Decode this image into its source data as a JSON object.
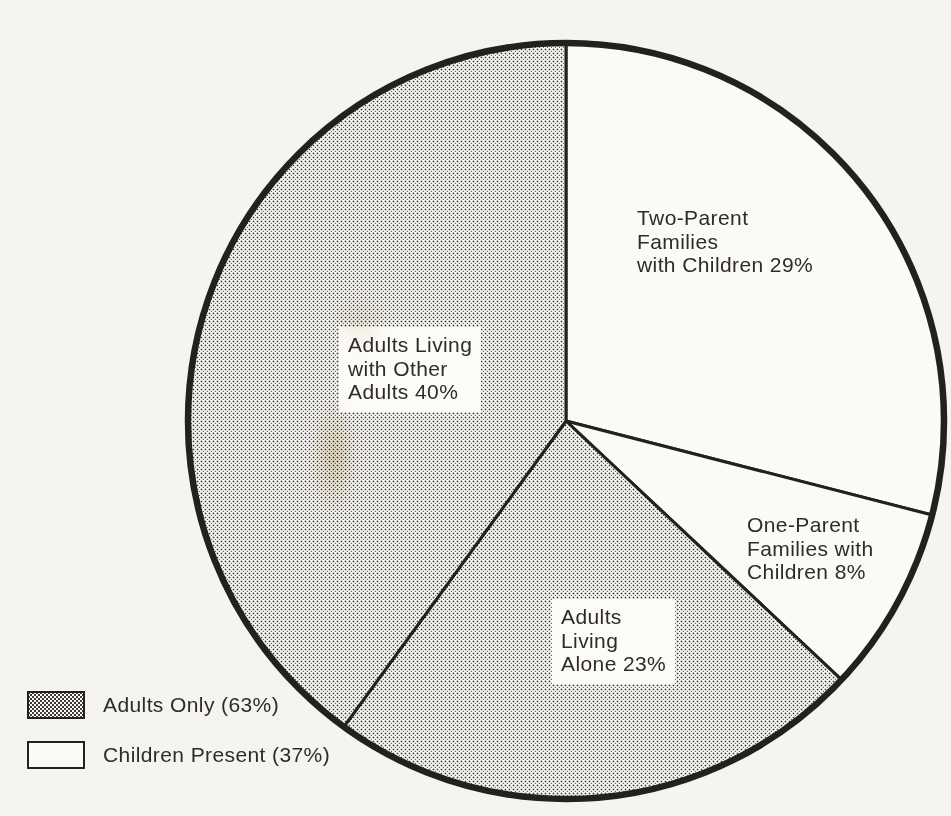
{
  "colors": {
    "ink": "#232120",
    "page_bg": "#f5f4f1",
    "slice_white": "#fbfaf7",
    "stipple_dot": "#3a3632",
    "label_box_bg": "#fcfbf8",
    "text": "#2e2c2a"
  },
  "chart_data": {
    "type": "pie",
    "direction": "clockwise",
    "start_angle_deg": 0,
    "slices": [
      {
        "label": "Two-Parent Families with Children",
        "value_pct": 29,
        "fill": "white",
        "display_text": "Two-Parent\nFamilies\nwith Children 29%"
      },
      {
        "label": "One-Parent Families with Children",
        "value_pct": 8,
        "fill": "white",
        "display_text": "One-Parent\nFamilies with\nChildren 8%"
      },
      {
        "label": "Adults Living Alone",
        "value_pct": 23,
        "fill": "stipple",
        "display_text": "Adults\nLiving\nAlone 23%"
      },
      {
        "label": "Adults Living with Other Adults",
        "value_pct": 40,
        "fill": "stipple",
        "display_text": "Adults Living\nwith Other\nAdults 40%"
      }
    ],
    "legend": [
      {
        "label": "Adults Only (63%)",
        "value_pct": 63,
        "fill": "stipple"
      },
      {
        "label": "Children Present (37%)",
        "value_pct": 37,
        "fill": "white"
      }
    ],
    "legend_position": "bottom-left"
  }
}
